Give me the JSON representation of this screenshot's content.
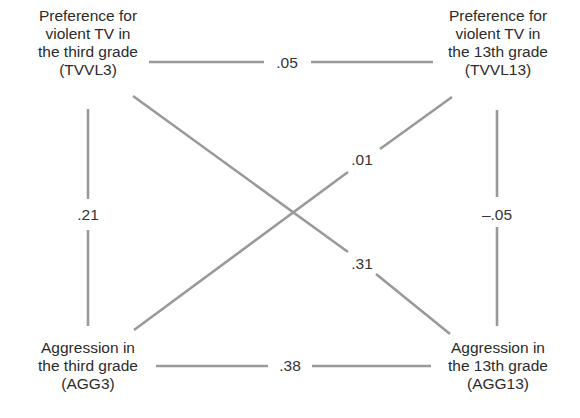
{
  "diagram": {
    "type": "cross-lagged-panel-correlation",
    "line_color": "#999999",
    "text_color": "#2b2b2b",
    "nodes": {
      "tvvl3": {
        "id": "TVVL3",
        "lines": [
          "Preference for",
          "violent TV in",
          "the third grade",
          "(TVVL3)"
        ]
      },
      "tvvl13": {
        "id": "TVVL13",
        "lines": [
          "Preference for",
          "violent TV in",
          "the 13th grade",
          "(TVVL13)"
        ]
      },
      "agg3": {
        "id": "AGG3",
        "lines": [
          "Aggression in",
          "the third grade",
          "(AGG3)"
        ]
      },
      "agg13": {
        "id": "AGG13",
        "lines": [
          "Aggression in",
          "the 13th grade",
          "(AGG13)"
        ]
      }
    },
    "edges": {
      "tvvl3_tvvl13": {
        "from": "TVVL3",
        "to": "TVVL13",
        "label": ".05"
      },
      "agg3_agg13": {
        "from": "AGG3",
        "to": "AGG13",
        "label": ".38"
      },
      "tvvl3_agg3": {
        "from": "TVVL3",
        "to": "AGG3",
        "label": ".21"
      },
      "tvvl13_agg13": {
        "from": "TVVL13",
        "to": "AGG13",
        "label": "–.05"
      },
      "tvvl3_agg13": {
        "from": "TVVL3",
        "to": "AGG13",
        "label": ".31"
      },
      "agg3_tvvl13": {
        "from": "AGG3",
        "to": "TVVL13",
        "label": ".01"
      }
    }
  }
}
